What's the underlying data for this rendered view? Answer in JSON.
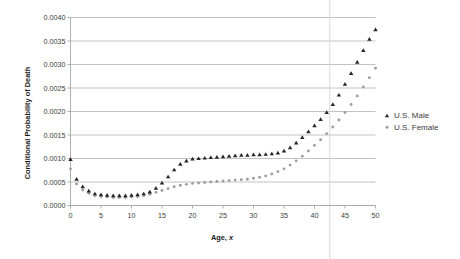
{
  "chart_data": {
    "type": "scatter",
    "title": "",
    "xlabel": "Age, x",
    "ylabel": "Conditional Probability of Death",
    "xlim": [
      0,
      50
    ],
    "ylim": [
      0,
      0.004
    ],
    "grid": true,
    "legend_position": "right",
    "xticks": [
      "0",
      "5",
      "10",
      "15",
      "20",
      "25",
      "30",
      "35",
      "40",
      "45",
      "50"
    ],
    "xtick_values": [
      0,
      5,
      10,
      15,
      20,
      25,
      30,
      35,
      40,
      45,
      50
    ],
    "yticks": [
      "0.0000",
      "0.0005",
      "0.0010",
      "0.0015",
      "0.0020",
      "0.0025",
      "0.0030",
      "0.0035",
      "0.0040"
    ],
    "ytick_values": [
      0.0,
      0.0005,
      0.001,
      0.0015,
      0.002,
      0.0025,
      0.003,
      0.0035,
      0.004
    ],
    "annotations": [
      {
        "type": "vertical-line",
        "x": 42.5,
        "color": "#d4d4d4"
      }
    ],
    "x": [
      0,
      1,
      2,
      3,
      4,
      5,
      6,
      7,
      8,
      9,
      10,
      11,
      12,
      13,
      14,
      15,
      16,
      17,
      18,
      19,
      20,
      21,
      22,
      23,
      24,
      25,
      26,
      27,
      28,
      29,
      30,
      31,
      32,
      33,
      34,
      35,
      36,
      37,
      38,
      39,
      40,
      41,
      42,
      43,
      44,
      45,
      46,
      47,
      48,
      49,
      50
    ],
    "series": [
      {
        "name": "U.S. Male",
        "marker": "triangle",
        "color": "#262626",
        "values": [
          0.00098,
          0.00056,
          0.0004,
          0.00031,
          0.00025,
          0.00023,
          0.00022,
          0.00021,
          0.00021,
          0.00021,
          0.00022,
          0.00023,
          0.00025,
          0.00029,
          0.00037,
          0.00048,
          0.00061,
          0.00076,
          0.00088,
          0.00095,
          0.00099,
          0.001,
          0.00101,
          0.00102,
          0.00103,
          0.00104,
          0.00105,
          0.00106,
          0.00107,
          0.00107,
          0.00108,
          0.00108,
          0.00109,
          0.0011,
          0.00112,
          0.00116,
          0.00123,
          0.00133,
          0.00145,
          0.00157,
          0.0017,
          0.00183,
          0.00198,
          0.00215,
          0.00235,
          0.00258,
          0.00281,
          0.00305,
          0.0033,
          0.00354,
          0.00374
        ]
      },
      {
        "name": "U.S. Female",
        "marker": "dot",
        "color": "#9e9e9e",
        "values": [
          0.00078,
          0.00046,
          0.00033,
          0.00026,
          0.00021,
          0.00019,
          0.00018,
          0.00017,
          0.00017,
          0.00017,
          0.00018,
          0.00019,
          0.00021,
          0.00024,
          0.00028,
          0.00032,
          0.00036,
          0.0004,
          0.00043,
          0.00045,
          0.00047,
          0.00048,
          0.00049,
          0.0005,
          0.00051,
          0.00052,
          0.00053,
          0.00054,
          0.00055,
          0.00056,
          0.00058,
          0.0006,
          0.00063,
          0.00067,
          0.00072,
          0.00078,
          0.00086,
          0.00095,
          0.00105,
          0.00116,
          0.00128,
          0.0014,
          0.00153,
          0.00167,
          0.00182,
          0.00198,
          0.00215,
          0.00233,
          0.00252,
          0.00272,
          0.00292
        ]
      }
    ]
  },
  "legend": {
    "items": [
      {
        "label": "U.S. Male"
      },
      {
        "label": "U.S. Female"
      }
    ]
  },
  "axes": {
    "y_title": "Conditional Probability of Death",
    "x_title_prefix": "Age, ",
    "x_title_var": "x"
  }
}
